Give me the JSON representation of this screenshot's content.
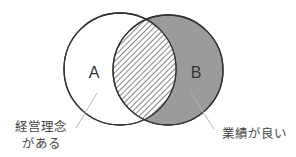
{
  "diagram": {
    "type": "venn",
    "sets": [
      {
        "id": "A",
        "letter": "A",
        "label_lines": [
          "経営理念",
          "がある"
        ],
        "fill": "#ffffff",
        "stroke": "#333333"
      },
      {
        "id": "B",
        "letter": "B",
        "label_lines": [
          "業績が良い"
        ],
        "fill": "#9b9b9b",
        "stroke": "#333333"
      }
    ],
    "intersection": {
      "sets": [
        "A",
        "B"
      ],
      "pattern": "diagonal-hatch",
      "fill": "#ffffff",
      "hatch_color": "#444444"
    },
    "leader_line_color": "#b5b5b5"
  }
}
